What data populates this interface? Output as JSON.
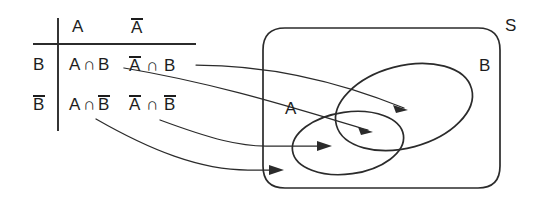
{
  "figure": {
    "kind": "venn-diagram-with-partition-table",
    "ink_color": "#2b2b2b"
  },
  "table": {
    "corner": "",
    "column_headers": [
      {
        "id": "col-A",
        "label": "A",
        "overbar": false
      },
      {
        "id": "col-Abar",
        "label": "A",
        "overbar": true
      }
    ],
    "row_headers": [
      {
        "id": "row-B",
        "label": "B",
        "overbar": false
      },
      {
        "id": "row-Bbar",
        "label": "B",
        "overbar": true
      }
    ],
    "cells": [
      {
        "id": "cell-A-inter-B",
        "left": {
          "letter": "A",
          "overbar": false
        },
        "operator": "∩",
        "right": {
          "letter": "B",
          "overbar": false
        },
        "plain": "A∩B"
      },
      {
        "id": "cell-Abar-inter-B",
        "left": {
          "letter": "A",
          "overbar": true
        },
        "operator": "∩",
        "right": {
          "letter": "B",
          "overbar": false
        },
        "plain": "Ā∩B"
      },
      {
        "id": "cell-A-inter-Bbar",
        "left": {
          "letter": "A",
          "overbar": false
        },
        "operator": "∩",
        "right": {
          "letter": "B",
          "overbar": true
        },
        "plain": "A∩B̄"
      },
      {
        "id": "cell-Abar-inter-Bbar",
        "left": {
          "letter": "A",
          "overbar": true
        },
        "operator": "∩",
        "right": {
          "letter": "B",
          "overbar": true
        },
        "plain": "Ā∩B̄"
      }
    ]
  },
  "venn": {
    "universe_label": "S",
    "set_labels": [
      {
        "id": "set-A",
        "label": "A"
      },
      {
        "id": "set-B",
        "label": "B"
      }
    ]
  },
  "connectors": [
    {
      "id": "connector-Abar-inter-B",
      "from": "cell-Abar-inter-B",
      "to": "region-B-only"
    },
    {
      "id": "connector-A-inter-B",
      "from": "cell-A-inter-B",
      "to": "region-A-and-B"
    },
    {
      "id": "connector-A-inter-Bbar",
      "from": "cell-A-inter-Bbar",
      "to": "region-A-only"
    },
    {
      "id": "connector-Abar-inter-Bbar",
      "from": "cell-Abar-inter-Bbar",
      "to": "region-outside"
    }
  ]
}
